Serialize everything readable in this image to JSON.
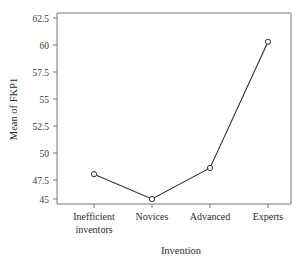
{
  "chart_data": {
    "type": "line",
    "title": "",
    "subtitle": "",
    "xlabel": "Invention",
    "ylabel": "Mean of FKP1",
    "categories": [
      "Inefficient inventors",
      "Novices",
      "Advanced",
      "Experts"
    ],
    "category_lines": [
      [
        "Inefficient",
        "inventors"
      ],
      [
        "Novices"
      ],
      [
        "Advanced"
      ],
      [
        "Experts"
      ]
    ],
    "values": [
      47.4,
      45.0,
      48.0,
      60.2
    ],
    "series": [
      {
        "name": "Mean of FKP1",
        "values": [
          47.4,
          45.0,
          48.0,
          60.2
        ]
      }
    ],
    "ylim": [
      44.0,
      63.4
    ],
    "yticks": [
      45,
      47.5,
      50,
      52.5,
      55,
      57.5,
      60,
      62.5
    ],
    "ytick_labels": [
      "45",
      "47.5",
      "50",
      "52.5",
      "55",
      "57.5",
      "60",
      "62.5"
    ],
    "grid": false,
    "legend": "none",
    "marker": "open-circle",
    "line_color": "#2f2f2f",
    "frame_color": "#777777",
    "background_color": "#ffffff"
  }
}
